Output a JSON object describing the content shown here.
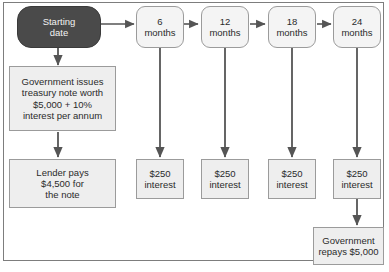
{
  "diagram": {
    "colors": {
      "start_node_fill": "#4a4a4a",
      "start_node_text": "#f2f2f2",
      "milestone_fill": "#f4f4f4",
      "box_fill": "#eeeeee",
      "border": "#9b9b9b",
      "arrow": "#555555",
      "frame": "#7d7d7d",
      "background": "#ffffff"
    },
    "nodes": {
      "start": {
        "label": "Starting\ndate",
        "shape": "rounded-dark"
      },
      "month6": {
        "label": "6\nmonths",
        "shape": "rounded-light"
      },
      "month12": {
        "label": "12\nmonths",
        "shape": "rounded-light"
      },
      "month18": {
        "label": "18\nmonths",
        "shape": "rounded-light"
      },
      "month24": {
        "label": "24\nmonths",
        "shape": "rounded-light"
      },
      "issue": {
        "label": "Government issues\ntreasury note worth\n$5,000 + 10%\ninterest per annum",
        "shape": "box"
      },
      "lender": {
        "label": "Lender pays\n$4,500 for\nthe note",
        "shape": "box"
      },
      "interest6": {
        "label": "$250\ninterest",
        "shape": "box"
      },
      "interest12": {
        "label": "$250\ninterest",
        "shape": "box"
      },
      "interest18": {
        "label": "$250\ninterest",
        "shape": "box"
      },
      "interest24": {
        "label": "$250\ninterest",
        "shape": "box"
      },
      "repay": {
        "label": "Government\nrepays $5,000",
        "shape": "box"
      }
    },
    "edges": [
      {
        "name": "start-to-6months",
        "from": "start",
        "to": "month6",
        "direction": "right"
      },
      {
        "name": "6months-to-12months",
        "from": "month6",
        "to": "month12",
        "direction": "right"
      },
      {
        "name": "12months-to-18months",
        "from": "month12",
        "to": "month18",
        "direction": "right"
      },
      {
        "name": "18months-to-24months",
        "from": "month18",
        "to": "month24",
        "direction": "right"
      },
      {
        "name": "start-to-issue",
        "from": "start",
        "to": "issue",
        "direction": "down"
      },
      {
        "name": "issue-to-lender",
        "from": "issue",
        "to": "lender",
        "direction": "down"
      },
      {
        "name": "6months-to-interest",
        "from": "month6",
        "to": "interest6",
        "direction": "down"
      },
      {
        "name": "12months-to-interest",
        "from": "month12",
        "to": "interest12",
        "direction": "down"
      },
      {
        "name": "18months-to-interest",
        "from": "month18",
        "to": "interest18",
        "direction": "down"
      },
      {
        "name": "24months-to-interest",
        "from": "month24",
        "to": "interest24",
        "direction": "down"
      },
      {
        "name": "interest24-to-repay",
        "from": "interest24",
        "to": "repay",
        "direction": "down"
      }
    ]
  }
}
